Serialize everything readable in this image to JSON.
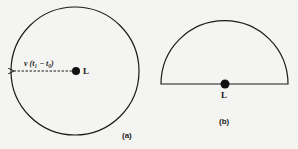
{
  "figure": {
    "panel_a": {
      "caption": "(a)",
      "point_label": "L",
      "radius_label": "v (t₁ − t₀)",
      "shape": "full-circle"
    },
    "panel_b": {
      "caption": "(b)",
      "point_label": "L",
      "shape": "semicircle"
    },
    "colors": {
      "stroke": "#1a1a1a",
      "background": "#f4f4f2"
    }
  }
}
